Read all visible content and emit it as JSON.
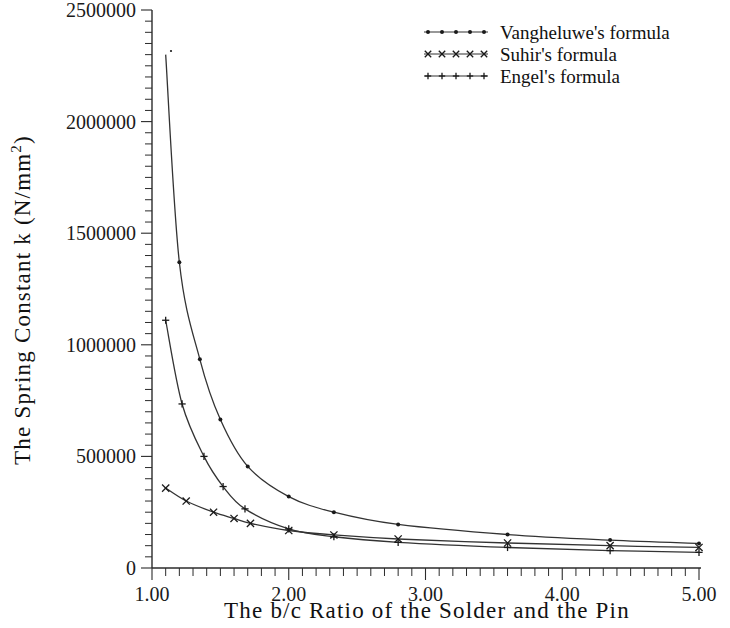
{
  "chart_data": {
    "type": "line",
    "title": "",
    "xlabel": "The b/c Ratio of the Solder and the Pin",
    "ylabel": "The Spring Constant k (N/mm²)",
    "xlim": [
      1.0,
      5.0
    ],
    "ylim": [
      0,
      2500000
    ],
    "xticks": [
      1.0,
      2.0,
      3.0,
      4.0,
      5.0
    ],
    "xticklabels": [
      "1.00",
      "2.00",
      "3.00",
      "4.00",
      "5.00"
    ],
    "yticks": [
      0,
      500000,
      1000000,
      1500000,
      2000000,
      2500000
    ],
    "yticklabels": [
      "0",
      "500000",
      "1000000",
      "1500000",
      "2000000",
      "2500000"
    ],
    "xminor_step": 0.1,
    "yminor_step": 50000,
    "grid": false,
    "legend_position": "top-right",
    "series": [
      {
        "name": "Vangheluwe's formula",
        "marker": "dot",
        "x": [
          1.1,
          1.2,
          1.35,
          1.5,
          1.7,
          2.0,
          2.33,
          2.8,
          3.6,
          4.35,
          5.0
        ],
        "y": [
          2300000,
          1370000,
          935000,
          665000,
          455000,
          320000,
          250000,
          195000,
          150000,
          125000,
          110000
        ]
      },
      {
        "name": "Suhir's formula",
        "marker": "x",
        "x": [
          1.1,
          1.25,
          1.45,
          1.6,
          1.72,
          2.0,
          2.33,
          2.8,
          3.6,
          4.35,
          5.0
        ],
        "y": [
          358000,
          300000,
          250000,
          222000,
          200000,
          168000,
          148000,
          130000,
          112000,
          100000,
          92000
        ]
      },
      {
        "name": "Engel's formula",
        "marker": "plus",
        "x": [
          1.1,
          1.22,
          1.38,
          1.52,
          1.68,
          2.0,
          2.33,
          2.8,
          3.6,
          4.35,
          5.0
        ],
        "y": [
          1110000,
          735000,
          500000,
          365000,
          265000,
          175000,
          140000,
          115000,
          92000,
          78000,
          70000
        ]
      }
    ]
  },
  "legend": {
    "items": [
      {
        "label": "Vangheluwe's formula",
        "marker": "dot"
      },
      {
        "label": "Suhir's formula",
        "marker": "x"
      },
      {
        "label": "Engel's formula",
        "marker": "plus"
      }
    ]
  },
  "axes": {
    "x_title": "The b/c Ratio of the Solder and the Pin",
    "y_title_main": "The Spring Constant k (N/mm",
    "y_title_sup": "2",
    "y_title_close": ")"
  }
}
